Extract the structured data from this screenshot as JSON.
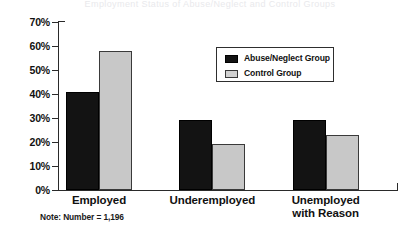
{
  "figure": {
    "title_faint": "Employment Status of Abuse/Neglect and Control Groups",
    "note": "Note: Number = 1,196"
  },
  "axis": {
    "y_ticks": [
      "70%",
      "60%",
      "50%",
      "40%",
      "30%",
      "20%",
      "10%",
      "0%"
    ]
  },
  "legend": {
    "entries": [
      {
        "label": "Abuse/Neglect Group",
        "color": "#131313"
      },
      {
        "label": "Control Group",
        "color": "#c8c8c8"
      }
    ]
  },
  "chart_data": {
    "type": "bar",
    "title": "",
    "xlabel": "",
    "ylabel": "",
    "ylim": [
      0,
      70
    ],
    "ytick_step": 10,
    "ytick_suffix": "%",
    "grid": false,
    "legend_position": "inside-upper-right",
    "categories": [
      "Employed",
      "Underemployed",
      "Unemployed with Reason"
    ],
    "category_lines": [
      [
        "Employed"
      ],
      [
        "Underemployed"
      ],
      [
        "Unemployed",
        "with Reason"
      ]
    ],
    "series": [
      {
        "name": "Abuse/Neglect Group",
        "color": "#131313",
        "values": [
          41,
          29,
          29
        ]
      },
      {
        "name": "Control Group",
        "color": "#c8c8c8",
        "values": [
          58,
          19,
          23
        ]
      }
    ],
    "annotations": [
      "Note: Number = 1,196"
    ]
  }
}
